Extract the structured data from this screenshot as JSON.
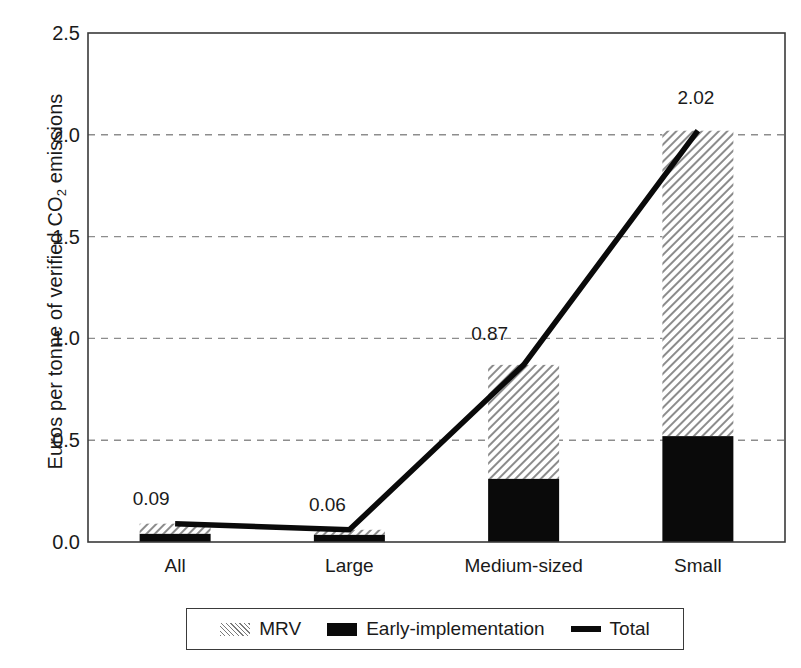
{
  "chart_data": {
    "type": "bar",
    "title": "",
    "xlabel": "",
    "ylabel": "Euros per tonne of verified CO2 emissions",
    "ylabel_prefix": "Euros per tonne of verified CO",
    "ylabel_sub": "2",
    "ylabel_suffix": " emissions",
    "categories": [
      "All",
      "Large",
      "Medium-sized",
      "Small"
    ],
    "ylim": [
      0.0,
      2.5
    ],
    "yticks": [
      "0.0",
      "0.5",
      "1.0",
      "1.5",
      "2.0",
      "2.5"
    ],
    "ytick_values": [
      0.0,
      0.5,
      1.0,
      1.5,
      2.0,
      2.5
    ],
    "grid": "horizontal-dashed",
    "legend_position": "below-axis",
    "stacked": true,
    "series": [
      {
        "name": "Early-implementation",
        "style": "solid-black-bar",
        "color": "#0a0a0a",
        "values": [
          0.04,
          0.035,
          0.31,
          0.52
        ]
      },
      {
        "name": "MRV",
        "style": "hatched-bar",
        "color": "#9a9a9a",
        "values": [
          0.05,
          0.025,
          0.56,
          1.5
        ]
      },
      {
        "name": "Total",
        "style": "line",
        "color": "#0a0a0a",
        "values": [
          0.09,
          0.06,
          0.87,
          2.02
        ]
      }
    ],
    "data_labels": [
      "0.09",
      "0.06",
      "0.87",
      "2.02"
    ]
  },
  "legend": {
    "items": [
      {
        "label": "MRV",
        "swatch": "hatch-swatch"
      },
      {
        "label": "Early-implementation",
        "swatch": "solid-swatch"
      },
      {
        "label": "Total",
        "swatch": "line-swatch"
      }
    ]
  }
}
